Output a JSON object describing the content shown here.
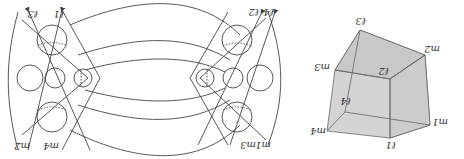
{
  "figure": {
    "orientation": "rotated 180 degrees",
    "left_panel": {
      "description": "Link diagram of circles and arcs with oriented strands",
      "strand_labels_top_left": [
        "ℓ3",
        "ℓ1"
      ],
      "strand_labels_bottom_left": [
        "m2",
        "m4"
      ],
      "strand_labels_top_right": [
        "ℓ2",
        "ℓ4"
      ],
      "strand_labels_bottom_right": [
        "m3",
        "m1"
      ]
    },
    "right_panel": {
      "description": "Shaded cube with labeled vertices",
      "vertices": [
        {
          "label": "ℓ3",
          "x": 360,
          "y": 30
        },
        {
          "label": "m2",
          "x": 425,
          "y": 55
        },
        {
          "label": "m3",
          "x": 335,
          "y": 70
        },
        {
          "label": "ℓ2",
          "x": 390,
          "y": 79
        },
        {
          "label": "m1",
          "x": 430,
          "y": 125
        },
        {
          "label": "ℓ4",
          "x": 345,
          "y": 112
        },
        {
          "label": "m4",
          "x": 327,
          "y": 131
        },
        {
          "label": "ℓ1",
          "x": 390,
          "y": 138
        }
      ]
    },
    "colors": {
      "line": "#444444",
      "cube_fill": "#cfcfcf",
      "cube_edge": "#666666"
    }
  },
  "labels": {
    "l_tl_1": "ℓ3",
    "l_tl_2": "ℓ1",
    "m_bl_1": "m2",
    "m_bl_2": "m4",
    "l_tr_1": "ℓ2",
    "l_tr_2": "ℓ4",
    "m_br_1": "m3",
    "m_br_2": "m1",
    "c_l3": "ℓ3",
    "c_m2": "m2",
    "c_m3": "m3",
    "c_l2": "ℓ2",
    "c_m1": "m1",
    "c_l4": "ℓ4",
    "c_m4": "m4",
    "c_l1": "ℓ1"
  }
}
